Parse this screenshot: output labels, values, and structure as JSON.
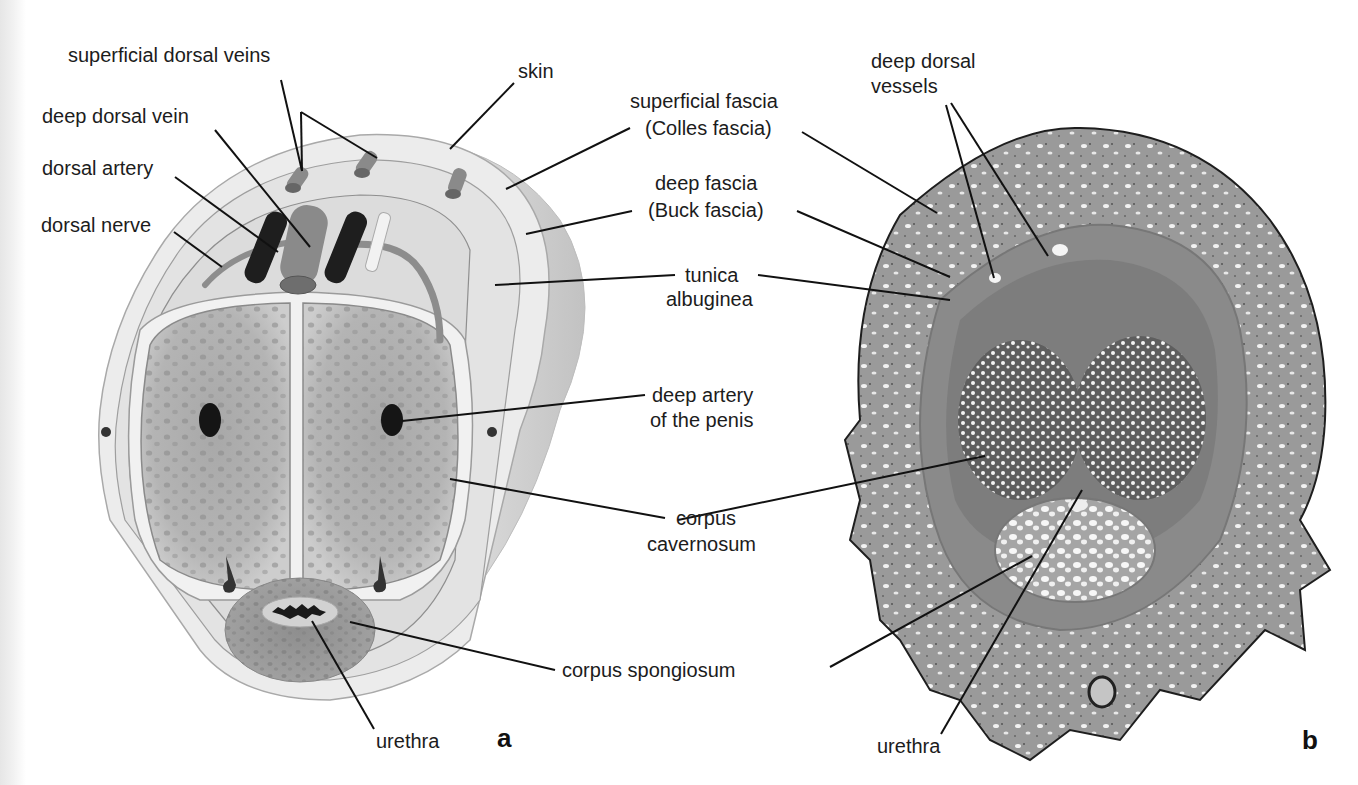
{
  "figure": {
    "panels": [
      {
        "id": "a",
        "letter": "a",
        "type": "illustration",
        "labels": {
          "superficial_dorsal_veins": "superficial dorsal veins",
          "deep_dorsal_vein": "deep dorsal vein",
          "dorsal_artery": "dorsal artery",
          "dorsal_nerve": "dorsal nerve",
          "skin": "skin",
          "urethra": "urethra"
        }
      },
      {
        "id": "b",
        "letter": "b",
        "type": "histology-micrograph",
        "labels": {
          "deep_dorsal_vessels_1": "deep dorsal",
          "deep_dorsal_vessels_2": "vessels",
          "urethra": "urethra"
        }
      }
    ],
    "shared_labels": {
      "superficial_fascia_1": "superficial fascia",
      "superficial_fascia_2": "(Colles fascia)",
      "deep_fascia_1": "deep fascia",
      "deep_fascia_2": "(Buck fascia)",
      "tunica_1": "tunica",
      "tunica_2": "albuginea",
      "deep_artery_1": "deep artery",
      "deep_artery_2": "of the penis",
      "corpus_cav_1": "corpus",
      "corpus_cav_2": "cavernosum",
      "corpus_spongiosum": "corpus spongiosum"
    },
    "colors": {
      "tissue_gray": "#9a9a9a",
      "vessel_dark": "#2a2a2a",
      "histology_stain": "#8c8c8c",
      "label_text": "#1c1c1c"
    }
  }
}
